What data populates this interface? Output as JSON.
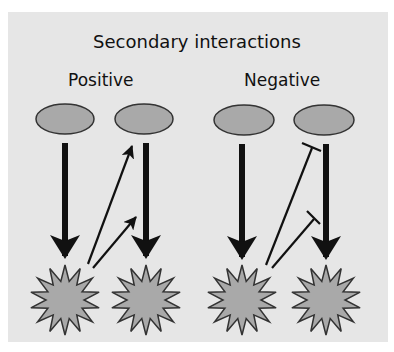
{
  "figure": {
    "title": "Secondary interactions",
    "groups": [
      {
        "label": "Positive",
        "interaction_type": "activation"
      },
      {
        "label": "Negative",
        "interaction_type": "inhibition"
      }
    ]
  },
  "colors": {
    "panel_background": "#e6e6e6",
    "node_fill": "#a9a9a9",
    "node_stroke": "#333333",
    "arrow": "#111111"
  },
  "nodes": {
    "regulators": [
      {
        "id": "pos-reg-1",
        "cx": 65,
        "cy": 119
      },
      {
        "id": "pos-reg-2",
        "cx": 144,
        "cy": 119
      },
      {
        "id": "neg-reg-1",
        "cx": 244,
        "cy": 120
      },
      {
        "id": "neg-reg-2",
        "cx": 324,
        "cy": 120
      }
    ],
    "targets": [
      {
        "id": "pos-target-1",
        "cx": 65,
        "cy": 300
      },
      {
        "id": "pos-target-2",
        "cx": 146,
        "cy": 300
      },
      {
        "id": "neg-target-1",
        "cx": 242,
        "cy": 300
      },
      {
        "id": "neg-target-2",
        "cx": 326,
        "cy": 300
      }
    ]
  },
  "edges": [
    {
      "from": "pos-reg-1",
      "to": "pos-target-1",
      "type": "primary-activation"
    },
    {
      "from": "pos-reg-2",
      "to": "pos-target-2",
      "type": "primary-activation"
    },
    {
      "from": "pos-target-1",
      "to": "pos-reg-2",
      "type": "secondary-activation"
    },
    {
      "from": "pos-target-1",
      "to": "pos-reg-2-edge",
      "type": "secondary-activation"
    },
    {
      "from": "neg-reg-1",
      "to": "neg-target-1",
      "type": "primary-activation"
    },
    {
      "from": "neg-reg-2",
      "to": "neg-target-2",
      "type": "primary-activation"
    },
    {
      "from": "neg-target-1",
      "to": "neg-reg-2",
      "type": "secondary-inhibition"
    },
    {
      "from": "neg-target-1",
      "to": "neg-reg-2-edge",
      "type": "secondary-inhibition"
    }
  ]
}
